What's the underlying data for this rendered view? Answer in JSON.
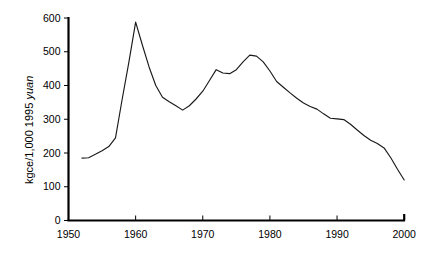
{
  "chart_data": {
    "type": "line",
    "title": "",
    "xlabel": "",
    "ylabel": "kgce/1,000 1995 yuan",
    "ylabel_plain": "kgce/1,000 1995 ",
    "ylabel_italic": "yuan",
    "xlim": [
      1950,
      2000
    ],
    "ylim": [
      0,
      600
    ],
    "xticks": [
      1950,
      1960,
      1970,
      1980,
      1990,
      2000
    ],
    "xticklabels": [
      "1950",
      "1960",
      "1970",
      "1980",
      "1990",
      "2000"
    ],
    "yticks": [
      0,
      100,
      200,
      300,
      400,
      500,
      600
    ],
    "yticklabels": [
      "0",
      "100",
      "200",
      "300",
      "400",
      "500",
      "600"
    ],
    "grid": false,
    "legend": false,
    "line_color": "#1a1a1a",
    "series": [
      {
        "name": "Energy intensity",
        "x": [
          1952,
          1953,
          1954,
          1955,
          1956,
          1957,
          1958,
          1959,
          1960,
          1961,
          1962,
          1963,
          1964,
          1965,
          1966,
          1967,
          1968,
          1969,
          1970,
          1971,
          1972,
          1973,
          1974,
          1975,
          1976,
          1977,
          1978,
          1979,
          1980,
          1981,
          1982,
          1983,
          1984,
          1985,
          1986,
          1987,
          1988,
          1989,
          1990,
          1991,
          1992,
          1993,
          1994,
          1995,
          1996,
          1997,
          1998,
          1999,
          2000
        ],
        "values": [
          185,
          186,
          196,
          207,
          219,
          245,
          360,
          470,
          588,
          520,
          455,
          400,
          365,
          352,
          340,
          327,
          340,
          360,
          383,
          415,
          447,
          437,
          435,
          447,
          470,
          490,
          487,
          470,
          443,
          412,
          395,
          378,
          362,
          348,
          338,
          330,
          316,
          303,
          301,
          299,
          285,
          268,
          252,
          238,
          228,
          215,
          186,
          152,
          120
        ]
      }
    ],
    "annotations": []
  }
}
